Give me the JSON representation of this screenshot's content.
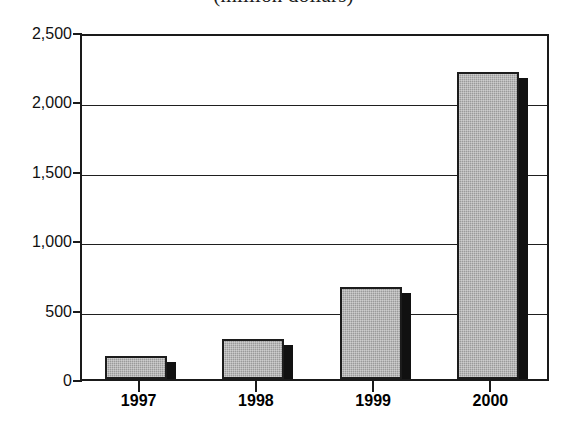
{
  "chart_data": {
    "type": "bar",
    "title": "(million dollars)",
    "xlabel": "",
    "ylabel": "",
    "categories": [
      "1997",
      "1998",
      "1999",
      "2000"
    ],
    "values": [
      168,
      290,
      660,
      2210
    ],
    "series": [
      {
        "name": "Value",
        "values": [
          168,
          290,
          660,
          2210
        ]
      }
    ],
    "ylim": [
      0,
      2500
    ],
    "ytick_values": [
      0,
      500,
      1000,
      1500,
      2000,
      2500
    ],
    "ytick_labels": [
      "0",
      "500",
      "1,000",
      "1,500",
      "2,000",
      "2,500"
    ],
    "grid": true,
    "legend": null,
    "legend_position": "none",
    "bar_fill_color": "#9a9a9a",
    "bar_shadow_color": "#111111",
    "bar_outline_color": "#1c1c1c",
    "axis_color": "#1a1a1a",
    "background_color": "#ffffff"
  }
}
